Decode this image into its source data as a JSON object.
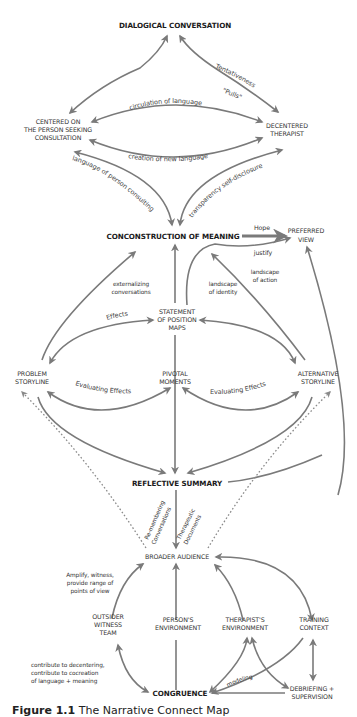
{
  "diagram": {
    "nodes": {
      "dialogical": "DIALOGICAL CONVERSATION",
      "centered_1": "CENTERED ON",
      "centered_2": "THE PERSON SEEKING",
      "centered_3": "CONSULTATION",
      "decentered_1": "DECENTERED",
      "decentered_2": "THERAPIST",
      "coconstruction": "CONCONSTRUCTION OF MEANING",
      "preferred_1": "PREFERRED",
      "preferred_2": "VIEW",
      "statement_1": "STATEMENT",
      "statement_2": "OF POSITION",
      "statement_3": "MAPS",
      "problem_1": "PROBLEM",
      "problem_2": "STORYLINE",
      "pivotal_1": "PIVOTAL",
      "pivotal_2": "MOMENTS",
      "alternative_1": "ALTERNATIVE",
      "alternative_2": "STORYLINE",
      "reflective": "REFLECTIVE SUMMARY",
      "broader": "BROADER AUDIENCE",
      "outsider_1": "OUTSIDER",
      "outsider_2": "WITNESS",
      "outsider_3": "TEAM",
      "persons_env_1": "PERSON'S",
      "persons_env_2": "ENVIRONMENT",
      "therapists_env_1": "THERAPIST'S",
      "therapists_env_2": "ENVIRONMENT",
      "training_1": "TRAINING",
      "training_2": "CONTEXT",
      "congruence": "CONGRUENCE",
      "debriefing_1": "DEBRIEFING +",
      "debriefing_2": "SUPERVISION"
    },
    "edge_labels": {
      "tentativeness": "Tentativeness",
      "pulls": "\"Pulls\"",
      "circulation": "circulation of language",
      "creation": "creation of new language",
      "language_person": "language of person consulting",
      "transparency": "transparency self-disclosure",
      "hope": "Hope",
      "justify": "justify",
      "externalizing_1": "externalizing",
      "externalizing_2": "conversations",
      "identity_1": "landscape",
      "identity_2": "of identity",
      "action_1": "landscape",
      "action_2": "of action",
      "effects": "Effects",
      "evaluating_left": "Evaluating Effects",
      "evaluating_right": "Evaluating Effects",
      "remembering_1": "Re-membering",
      "remembering_2": "Conversations",
      "therapeutic_1": "Therapeutic",
      "therapeutic_2": "Documents",
      "amplify_1": "Amplify, witness,",
      "amplify_2": "provide range of",
      "amplify_3": "points of view",
      "contribute_1": "contribute to decentering,",
      "contribute_2": "contribute to cocreation",
      "contribute_3": "of language + meaning",
      "modeling": "modeling"
    },
    "caption": {
      "number": "Figure 1.1",
      "title": "The Narrative Connect Map"
    }
  }
}
